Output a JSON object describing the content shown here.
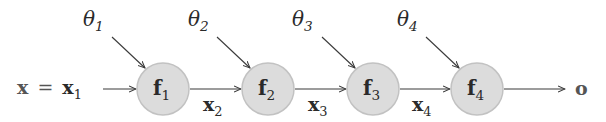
{
  "diagram": {
    "type": "computation-chain",
    "input": {
      "lhs": "x",
      "eq": "=",
      "rhs": "x",
      "rhs_sub": "1"
    },
    "nodes": [
      {
        "name": "f",
        "sub": "1",
        "param": "θ",
        "param_sub": "1"
      },
      {
        "name": "f",
        "sub": "2",
        "param": "θ",
        "param_sub": "2"
      },
      {
        "name": "f",
        "sub": "3",
        "param": "θ",
        "param_sub": "3"
      },
      {
        "name": "f",
        "sub": "4",
        "param": "θ",
        "param_sub": "4"
      }
    ],
    "edges": [
      {
        "label": "x",
        "sub": "2"
      },
      {
        "label": "x",
        "sub": "3"
      },
      {
        "label": "x",
        "sub": "4"
      }
    ],
    "output": "o",
    "colors": {
      "node_fill": "#dcdcdc",
      "node_stroke": "#c2c2c2",
      "edge": "#3a3a3a",
      "text": "#2a2a2a"
    }
  }
}
